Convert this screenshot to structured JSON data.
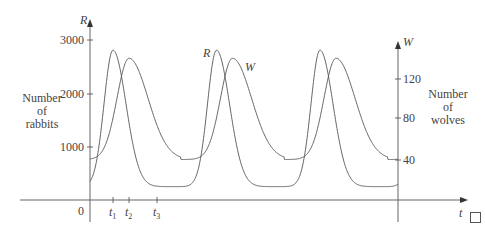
{
  "chart_data": {
    "type": "line",
    "title": "",
    "xlabel": "t",
    "ylabel_left": "R",
    "ylabel_right": "W",
    "left_axis_caption": [
      "Number",
      "of",
      "rabbits"
    ],
    "right_axis_caption": [
      "Number",
      "of",
      "wolves"
    ],
    "left_ticks": [
      "3000",
      "2000",
      "1000"
    ],
    "left_tick_values": [
      3000,
      2000,
      1000
    ],
    "right_ticks": [
      "120",
      "80",
      "40"
    ],
    "right_tick_values": [
      120,
      80,
      40
    ],
    "origin_label": "0",
    "x_ticks": [
      "t1",
      "t2",
      "t3"
    ],
    "ylim_left": [
      0,
      3000
    ],
    "ylim_right": [
      0,
      140
    ],
    "grid": false,
    "legend": "inline labels",
    "series": [
      {
        "name": "R",
        "label": "R",
        "axis": "left",
        "description": "Rabbit population, periodic",
        "peak": 2800,
        "trough": 250,
        "start": 1000,
        "peaks_at": [
          "t1",
          "~2.0 periods",
          "~3.0 periods"
        ]
      },
      {
        "name": "W",
        "label": "W",
        "axis": "right",
        "description": "Wolf population, periodic, lags R",
        "peak": 140,
        "trough": 40,
        "start": 40,
        "peaks_at": [
          "t2"
        ]
      }
    ],
    "annotations": [
      "R",
      "W"
    ]
  },
  "labels": {
    "R_axis": "R",
    "W_axis": "W",
    "t_axis": "t",
    "origin": "0",
    "left_ticks": [
      "3000",
      "2000",
      "1000"
    ],
    "right_ticks": [
      "120",
      "80",
      "40"
    ],
    "rabbits": [
      "Number",
      "of",
      "rabbits"
    ],
    "wolves": [
      "Number",
      "of",
      "wolves"
    ],
    "t1": "t",
    "t1_sub": "1",
    "t2": "t",
    "t2_sub": "2",
    "t3": "t",
    "t3_sub": "3",
    "curve_R": "R",
    "curve_W": "W"
  }
}
